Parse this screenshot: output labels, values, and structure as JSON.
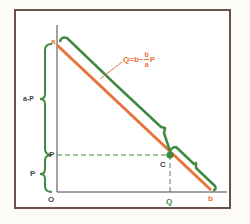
{
  "diagram": {
    "colors": {
      "frame": "#6b5148",
      "axes": "#444444",
      "demand_line": "#e8733a",
      "brackets": "#3f8a3f",
      "dashed": "#3f8a3f",
      "background": "#fdfbf5"
    },
    "labels": {
      "a": "a",
      "b": "b",
      "origin": "O",
      "P_axis": "P",
      "Q_axis": "Q",
      "C": "C",
      "a_minus_P": "a-P",
      "P_brace": "P"
    },
    "formula": {
      "lhs": "Q=b−",
      "frac_num": "b",
      "frac_den": "a",
      "rhs": "P",
      "full_text": "Q = b − (b/a) P"
    },
    "icons": {
      "point_c": "filled-circle",
      "brace": "curly-brace"
    }
  }
}
